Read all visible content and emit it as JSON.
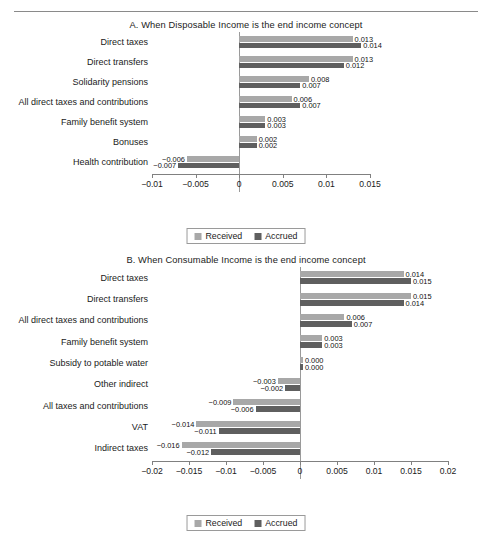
{
  "figure": {
    "legend": {
      "received_label": "Received",
      "accrued_label": "Accrued"
    }
  },
  "chart_data": [
    {
      "id": "panelA",
      "type": "bar",
      "orientation": "horizontal",
      "title": "A. When Disposable Income is the end income concept",
      "xlabel": "",
      "ylabel": "",
      "xlim": [
        -0.01,
        0.015
      ],
      "xticks": [
        -0.01,
        -0.005,
        0,
        0.005,
        0.01,
        0.015
      ],
      "xticklabels": [
        "−0.01",
        "−0.005",
        "0",
        "0.005",
        "0.01",
        "0.015"
      ],
      "grid": false,
      "legend_position": "bottom-center",
      "categories": [
        "Direct taxes",
        "Direct transfers",
        "Solidarity pensions",
        "All direct taxes and contributions",
        "Family benefit system",
        "Bonuses",
        "Health contribution"
      ],
      "series": [
        {
          "name": "Received",
          "color": "#a8a8a8",
          "values": [
            0.013,
            0.013,
            0.008,
            0.006,
            0.003,
            0.002,
            -0.006
          ],
          "labels": [
            "0.013",
            "0.013",
            "0.008",
            "0.006",
            "0.003",
            "0.002",
            "−0.006"
          ]
        },
        {
          "name": "Accrued",
          "color": "#5f5f5f",
          "values": [
            0.014,
            0.012,
            0.007,
            0.007,
            0.003,
            0.002,
            -0.007
          ],
          "labels": [
            "0.014",
            "0.012",
            "0.007",
            "0.007",
            "0.003",
            "0.002",
            "−0.007"
          ]
        }
      ]
    },
    {
      "id": "panelB",
      "type": "bar",
      "orientation": "horizontal",
      "title": "B. When Consumable Income is the end income concept",
      "xlabel": "",
      "ylabel": "",
      "xlim": [
        -0.02,
        0.02
      ],
      "xticks": [
        -0.02,
        -0.015,
        -0.01,
        -0.005,
        0,
        0.005,
        0.01,
        0.015,
        0.02
      ],
      "xticklabels": [
        "−0.02",
        "−0.015",
        "−0.01",
        "−0.005",
        "0",
        "0.005",
        "0.01",
        "0.015",
        "0.02"
      ],
      "grid": false,
      "legend_position": "bottom-center",
      "categories": [
        "Direct taxes",
        "Direct transfers",
        "All direct taxes and contributions",
        "Family benefit system",
        "Subsidy to potable water",
        "Other indirect",
        "All taxes and contributions",
        "VAT",
        "Indirect taxes"
      ],
      "series": [
        {
          "name": "Received",
          "color": "#a8a8a8",
          "values": [
            0.014,
            0.015,
            0.006,
            0.003,
            0.0004,
            -0.003,
            -0.009,
            -0.014,
            -0.016
          ],
          "labels": [
            "0.014",
            "0.015",
            "0.006",
            "0.003",
            "0.000",
            "−0.003",
            "−0.009",
            "−0.014",
            "−0.016"
          ]
        },
        {
          "name": "Accrued",
          "color": "#5f5f5f",
          "values": [
            0.015,
            0.014,
            0.007,
            0.003,
            0.0004,
            -0.002,
            -0.006,
            -0.011,
            -0.012
          ],
          "labels": [
            "0.015",
            "0.014",
            "0.007",
            "0.003",
            "0.000",
            "−0.002",
            "−0.006",
            "−0.011",
            "−0.012"
          ]
        }
      ]
    }
  ]
}
